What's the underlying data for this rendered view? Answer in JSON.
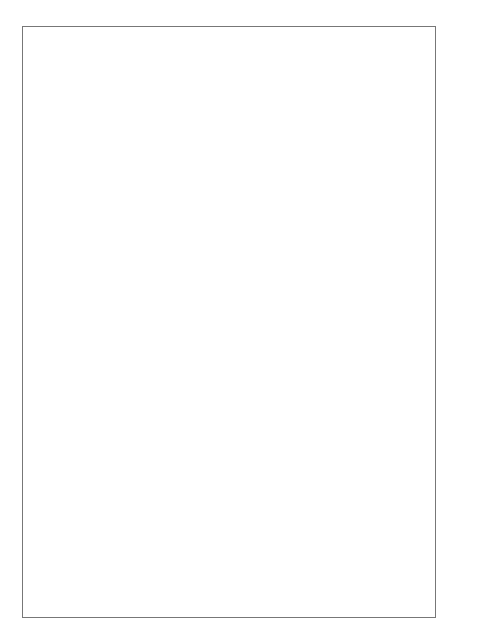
{
  "page_header": {
    "running_title": "THE ASIAN MONSOON",
    "page_number": "243"
  },
  "side_note": {
    "numerator": "1",
    "denominator": "10",
    "unit": "S"
  },
  "upper_panel": {
    "temperature_axis": {
      "label": "TEMPERATURE",
      "unit": "°C",
      "ticks": [
        "34",
        "32",
        "30",
        "28",
        "26",
        "24",
        "22",
        "20",
        "18",
        "16",
        "14",
        "12",
        "10",
        "8",
        "6",
        "4",
        "2",
        "0",
        "-2"
      ]
    },
    "vapor_axis": {
      "label": "VAPOR PRESSURE",
      "unit": "mb",
      "ticks": [
        "28",
        "26",
        "24",
        "22",
        "20",
        "18",
        "16",
        "14",
        "12",
        "10",
        "8",
        "6",
        "4"
      ]
    },
    "sunshine_axis": {
      "label": "SUNSHINE",
      "unit": "HOURS",
      "ticks": [
        "8",
        "6",
        "4"
      ]
    },
    "cloud_axis": {
      "label": "CLOUD COVER",
      "ticks": [
        "8/10",
        "6/10",
        "4/10"
      ],
      "header_fraction": "1/10 S"
    },
    "curve_labels": {
      "max_temp": "MAX. TEMP.",
      "min_temp": "MIN. TEMP.",
      "vapor_line1": "VAPOR",
      "vapor_line2": "PRESSURE",
      "sunshine": "DURATION OF SUNSHINE",
      "cloud": "AMOUNT OF CLOUD"
    }
  },
  "month_axis": {
    "month_end_days": [
      "31",
      "28",
      "31",
      "30",
      "31",
      "30",
      "31",
      "31",
      "30",
      "31",
      "30",
      "31"
    ],
    "months": [
      "J",
      "F",
      "M",
      "A",
      "M",
      "J",
      "J",
      "A",
      "S",
      "O",
      "N",
      "D"
    ]
  },
  "seasons": [
    {
      "l1": "WINTER",
      "l2": "MONSOON",
      "l3": "SEASON"
    },
    {
      "l1": "",
      "l2": "SPRING",
      "l3": ""
    },
    {
      "l1": "BAI-U",
      "l2": "SEASON",
      "l3": ""
    },
    {
      "l1": "MID",
      "l2": "SUMMER",
      "l3": ""
    },
    {
      "l1": "SHURIN",
      "l2": "SEASON",
      "l3": ""
    },
    {
      "l1": "LATE",
      "l2": "AUTUMN",
      "l3": ""
    },
    {
      "l1": "WINTER",
      "l2": "MONSOON",
      "l3": "SEASON"
    }
  ],
  "chart_data": [
    {
      "type": "line",
      "title": "Annual march of temperature, vapor pressure, sunshine and cloud",
      "xlabel": "Month",
      "x": [
        "J",
        "F",
        "M",
        "A",
        "M",
        "J",
        "J",
        "A",
        "S",
        "O",
        "N",
        "D"
      ],
      "series": [
        {
          "name": "MAX. TEMP.",
          "axis": "°C",
          "values": [
            8,
            8,
            11,
            16,
            21,
            25,
            29,
            32,
            28,
            22,
            16,
            10
          ]
        },
        {
          "name": "MIN. TEMP.",
          "axis": "°C",
          "values": [
            -1,
            -1,
            2,
            7,
            12,
            17,
            21,
            23,
            20,
            13,
            6,
            1
          ]
        },
        {
          "name": "VAPOR PRESSURE",
          "axis": "mb",
          "values": [
            5,
            5,
            6,
            9,
            13,
            19,
            25,
            26,
            22,
            14,
            9,
            6
          ]
        },
        {
          "name": "DURATION OF SUNSHINE",
          "axis": "hours",
          "values": [
            5.5,
            5.8,
            6.0,
            6.5,
            6.8,
            5.2,
            6.8,
            7.5,
            5.3,
            5.5,
            5.5,
            5.3
          ]
        },
        {
          "name": "AMOUNT OF CLOUD",
          "axis": "tenths",
          "values": [
            4.8,
            4.9,
            5.5,
            6.2,
            6.5,
            7.2,
            6.5,
            6.0,
            6.8,
            5.5,
            5.0,
            4.8
          ]
        }
      ],
      "ylim_temp": [
        -2,
        34
      ],
      "ylim_vapor": [
        4,
        28
      ],
      "grid": false
    },
    {
      "type": "bar",
      "title": "Mean rainfall by 10-day period",
      "ylabel": "MEAN RAINFALL",
      "yunit": "mm",
      "ylim": [
        0,
        200
      ],
      "yticks": [
        0,
        20,
        40,
        60,
        80,
        100,
        120,
        140,
        160,
        180,
        200
      ],
      "categories": [
        "J1",
        "J2",
        "J3",
        "F1",
        "F2",
        "F3",
        "M1",
        "M2",
        "M3",
        "A1",
        "A2",
        "A3",
        "My1",
        "My2",
        "My3",
        "Jn1",
        "Jn2",
        "Jn3",
        "Jl1",
        "Jl2",
        "Jl3",
        "Au1",
        "Au2",
        "Au3",
        "S1",
        "S2",
        "S3",
        "O1",
        "O2",
        "O3",
        "N1",
        "N2",
        "N3",
        "D1",
        "D2",
        "D3"
      ],
      "series": [
        {
          "name": "Mean rainfall (hatched)",
          "values": [
            35,
            72,
            18,
            30,
            38,
            52,
            75,
            47,
            63,
            113,
            75,
            68,
            118,
            78,
            76,
            145,
            115,
            156,
            80,
            138,
            79,
            56,
            94,
            89,
            63,
            68,
            58,
            57,
            49,
            54,
            46,
            53,
            75,
            49,
            19,
            40
          ]
        },
        {
          "name": "Range/excess (black) top",
          "values": [
            0,
            0,
            0,
            0,
            0,
            0,
            0,
            0,
            0,
            0,
            0,
            0,
            0,
            0,
            0,
            165,
            0,
            185,
            93,
            156,
            0,
            62,
            102,
            64,
            115,
            151,
            94,
            83,
            0,
            0,
            62,
            0,
            78,
            0,
            0,
            0
          ]
        },
        {
          "name": "Range/excess (black) bottom",
          "values": [
            0,
            0,
            0,
            0,
            0,
            0,
            0,
            0,
            0,
            0,
            0,
            0,
            0,
            0,
            0,
            145,
            0,
            156,
            80,
            138,
            0,
            56,
            89,
            25,
            63,
            58,
            57,
            66,
            0,
            0,
            38,
            0,
            75,
            0,
            0,
            0
          ]
        }
      ]
    }
  ]
}
